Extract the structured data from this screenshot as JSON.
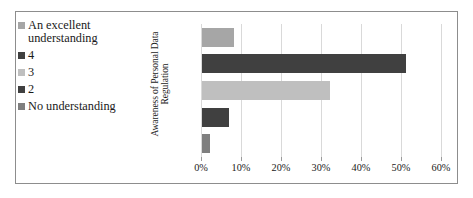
{
  "figure": {
    "frame_color": "#8d8d8d",
    "background": "#ffffff"
  },
  "legend": {
    "position": "left",
    "items": [
      {
        "label": "An excellent\nunderstanding",
        "color": "#a6a6a6"
      },
      {
        "label": "4",
        "color": "#404040"
      },
      {
        "label": "3",
        "color": "#bfbfbf"
      },
      {
        "label": "2",
        "color": "#404040"
      },
      {
        "label": "No understanding",
        "color": "#7f7f7f"
      }
    ]
  },
  "axes": {
    "y_title_line1": "Awareness of Personal Data",
    "y_title_line2": "Regulation",
    "x_tick_labels": [
      "0%",
      "10%",
      "20%",
      "30%",
      "40%",
      "50%",
      "60%"
    ]
  },
  "chart_data": {
    "type": "bar",
    "orientation": "horizontal",
    "title": "",
    "xlabel": "",
    "ylabel": "Awareness of Personal Data Regulation",
    "categories": [
      "An excellent understanding",
      "4",
      "3",
      "2",
      "No understanding"
    ],
    "values": [
      8.0,
      51.0,
      32.0,
      6.8,
      2.0
    ],
    "value_labels": [
      "8%",
      "51%",
      "32%",
      "6.8%",
      "2%"
    ],
    "colors": [
      "#a6a6a6",
      "#404040",
      "#bfbfbf",
      "#404040",
      "#7f7f7f"
    ],
    "xlim": [
      0,
      60
    ],
    "xtick_values": [
      0,
      10,
      20,
      30,
      40,
      50,
      60
    ],
    "xtick_labels": [
      "0%",
      "10%",
      "20%",
      "30%",
      "40%",
      "50%",
      "60%"
    ],
    "grid": "vertical",
    "legend_position": "left"
  }
}
